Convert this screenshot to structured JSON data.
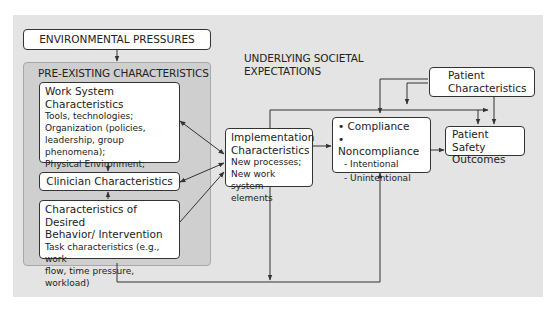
{
  "diagram": {
    "environmental_pressures": "ENVIRONMENTAL PRESSURES",
    "pre_existing_title": "PRE-EXISTING CHARACTERISTICS",
    "societal_expectations": [
      "UNDERLYING SOCIETAL",
      "EXPECTATIONS"
    ],
    "work_system": {
      "title": "Work System Characteristics",
      "lines": [
        "Tools, technologies;",
        "Organization (policies,",
        "leadership, group phenomena);",
        "Physical Environment;",
        "Existing Processes"
      ]
    },
    "clinician": {
      "title": "Clinician Characteristics"
    },
    "desired_behavior": {
      "title": [
        "Characteristics of Desired",
        "Behavior/ Intervention"
      ],
      "lines": [
        "Task characteristics (e.g., work",
        "flow, time pressure, workload)"
      ]
    },
    "implementation": {
      "title": [
        "Implementation",
        "Characteristics"
      ],
      "lines": [
        "New processes;",
        "New work system",
        "elements"
      ]
    },
    "compliance": {
      "bullets": [
        "• Compliance",
        "• Noncompliance"
      ],
      "sub": [
        "- Intentional",
        "- Unintentional"
      ]
    },
    "patient_characteristics": [
      "Patient",
      "Characteristics"
    ],
    "patient_safety": [
      "Patient Safety",
      "Outcomes"
    ]
  },
  "colors": {
    "panel": "#e4e4e4",
    "pre_panel": "#cfcfcf",
    "box": "#ffffff",
    "line": "#333333"
  }
}
